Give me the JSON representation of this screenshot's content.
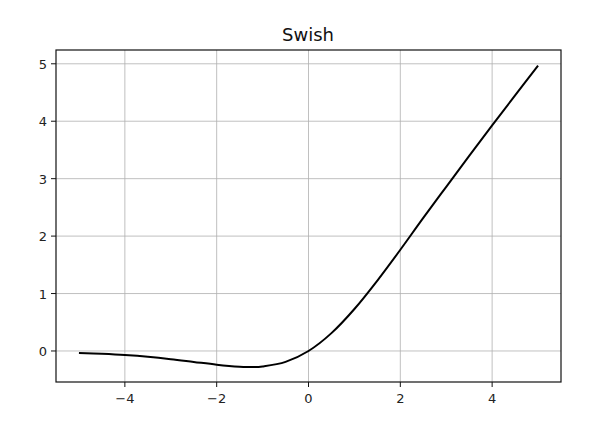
{
  "chart_data": {
    "type": "line",
    "title": "Swish",
    "xlabel": "",
    "ylabel": "",
    "xlim": [
      -5.5,
      5.5
    ],
    "ylim": [
      -0.54,
      5.24
    ],
    "xticks": [
      -4,
      -2,
      0,
      2,
      4
    ],
    "xtick_labels": [
      "−4",
      "−2",
      "0",
      "2",
      "4"
    ],
    "yticks": [
      0,
      1,
      2,
      3,
      4,
      5
    ],
    "ytick_labels": [
      "0",
      "1",
      "2",
      "3",
      "4",
      "5"
    ],
    "grid": true,
    "legend": null,
    "series": [
      {
        "name": "swish(x) = x * sigmoid(x)",
        "color": "#000000",
        "x": [
          -5,
          -4.5,
          -4,
          -3.5,
          -3,
          -2.5,
          -2,
          -1.5,
          -1.28,
          -1,
          -0.5,
          0,
          0.5,
          1,
          1.5,
          2,
          2.5,
          3,
          3.5,
          4,
          4.5,
          5
        ],
        "y": [
          -0.033,
          -0.05,
          -0.072,
          -0.102,
          -0.142,
          -0.19,
          -0.238,
          -0.274,
          -0.278,
          -0.269,
          -0.189,
          0.0,
          0.311,
          0.731,
          1.226,
          1.762,
          2.317,
          2.858,
          3.396,
          3.928,
          4.45,
          4.967
        ]
      }
    ]
  }
}
